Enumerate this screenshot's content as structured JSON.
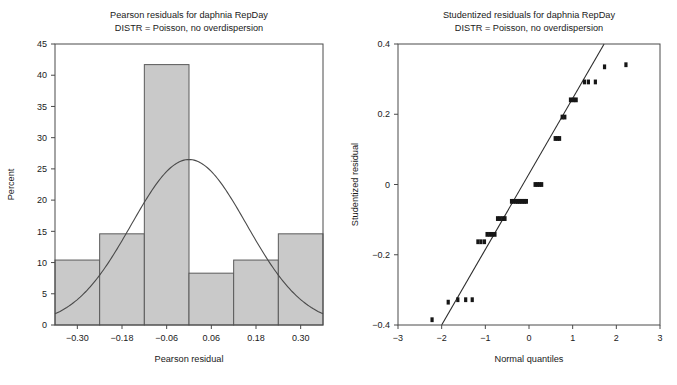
{
  "page": {
    "background": "#ffffff",
    "ink": "#1a1a1a",
    "bar_fill": "#c9c9c9",
    "bar_stroke": "#5a5a5a",
    "point_color": "#161616",
    "line_color": "#2b2b2b"
  },
  "left_panel": {
    "title_line1": "Pearson residuals for daphnia RepDay",
    "title_line2": "DISTR = Poisson, no overdispersion",
    "xlabel": "Pearson residual",
    "ylabel": "Percent"
  },
  "right_panel": {
    "title_line1": "Studentized residuals for daphnia RepDay",
    "title_line2": "DISTR = Poisson, no overdispersion",
    "xlabel": "Normal quantiles",
    "ylabel": "Studentized residual"
  },
  "chart_data": [
    {
      "type": "bar",
      "id": "pearson-residual-histogram",
      "title": "Pearson residuals for daphnia RepDay",
      "subtitle": "DISTR = Poisson, no overdispersion",
      "xlabel": "Pearson residual",
      "ylabel": "Percent",
      "xlim": [
        -0.36,
        0.36
      ],
      "ylim": [
        0,
        45
      ],
      "grid": false,
      "legend": "none",
      "xticks": [
        -0.3,
        -0.18,
        -0.06,
        0.06,
        0.18,
        0.3
      ],
      "xtick_labels": [
        "-0.30",
        "-0.18",
        "-0.06",
        "0.06",
        "0.18",
        "0.30"
      ],
      "yticks": [
        0,
        5,
        10,
        15,
        20,
        25,
        30,
        35,
        40,
        45
      ],
      "ytick_labels": [
        "0",
        "5",
        "10",
        "15",
        "20",
        "25",
        "30",
        "35",
        "40",
        "45"
      ],
      "bin_width": 0.12,
      "bin_centers": [
        -0.3,
        -0.18,
        -0.06,
        0.06,
        0.18,
        0.3
      ],
      "bin_edges": [
        -0.36,
        -0.24,
        -0.12,
        0.0,
        0.12,
        0.24,
        0.36
      ],
      "categories": [
        "-0.30",
        "-0.18",
        "-0.06",
        "0.06",
        "0.18",
        "0.30"
      ],
      "values": [
        10.4,
        14.6,
        41.7,
        8.3,
        10.4,
        14.6
      ],
      "overlay": {
        "name": "normal density curve",
        "type": "line",
        "peak_percent": 26.5,
        "mean": 0.0,
        "sigma": 0.155,
        "endpoints_percent": [
          3.7,
          3.7
        ]
      }
    },
    {
      "type": "scatter",
      "id": "studentized-residual-qq-plot",
      "title": "Studentized residuals for daphnia RepDay",
      "subtitle": "DISTR = Poisson, no overdispersion",
      "xlabel": "Normal quantiles",
      "ylabel": "Studentized residual",
      "xlim": [
        -3,
        3
      ],
      "ylim": [
        -0.4,
        0.4
      ],
      "grid": false,
      "legend": "none",
      "xticks": [
        -3,
        -2,
        -1,
        0,
        1,
        2,
        3
      ],
      "xtick_labels": [
        "-3",
        "-2",
        "-1",
        "0",
        "1",
        "2",
        "3"
      ],
      "yticks": [
        -0.4,
        -0.2,
        0,
        0.2,
        0.4
      ],
      "ytick_labels": [
        "-0.4",
        "-0.2",
        "0",
        "0.2",
        "0.4"
      ],
      "reference_line": {
        "name": "normal reference line",
        "x": [
          -2.0,
          1.72
        ],
        "y": [
          -0.4,
          0.4
        ]
      },
      "x": [
        -2.22,
        -1.85,
        -1.63,
        -1.45,
        -1.3,
        -1.17,
        -1.1,
        -1.02,
        -0.96,
        -0.9,
        -0.84,
        -0.78,
        -0.72,
        -0.66,
        -0.6,
        -0.55,
        -0.4,
        -0.35,
        -0.3,
        -0.26,
        -0.22,
        -0.18,
        -0.14,
        -0.1,
        -0.06,
        0.14,
        0.19,
        0.24,
        0.29,
        0.6,
        0.65,
        0.7,
        0.76,
        0.82,
        0.95,
        1.02,
        1.08,
        1.27,
        1.36,
        1.52,
        1.73,
        2.22
      ],
      "y": [
        -0.385,
        -0.335,
        -0.328,
        -0.328,
        -0.328,
        -0.163,
        -0.163,
        -0.163,
        -0.142,
        -0.142,
        -0.142,
        -0.142,
        -0.097,
        -0.097,
        -0.097,
        -0.097,
        -0.048,
        -0.048,
        -0.048,
        -0.048,
        -0.048,
        -0.048,
        -0.048,
        -0.048,
        -0.048,
        0.0,
        0.0,
        0.0,
        0.0,
        0.131,
        0.131,
        0.131,
        0.192,
        0.192,
        0.241,
        0.241,
        0.241,
        0.292,
        0.292,
        0.292,
        0.335,
        0.341
      ]
    }
  ]
}
